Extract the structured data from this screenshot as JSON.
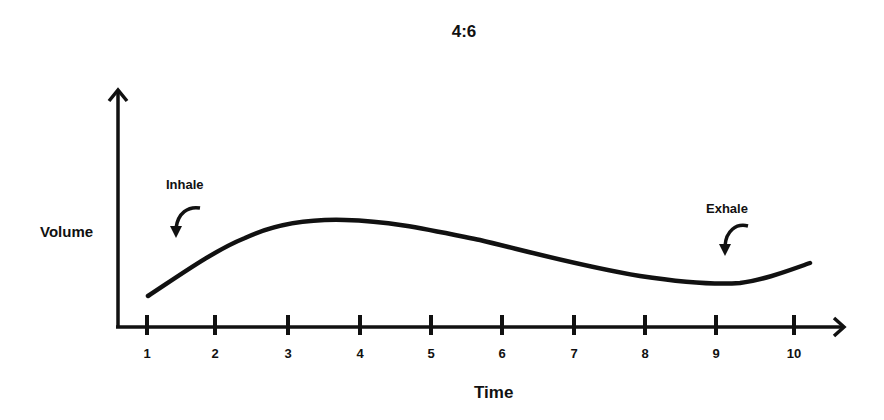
{
  "chart_data": {
    "type": "line",
    "title": "4:6",
    "xlabel": "Time",
    "ylabel": "Volume",
    "x_ticks": [
      "1",
      "2",
      "3",
      "4",
      "5",
      "6",
      "7",
      "8",
      "9",
      "10"
    ],
    "xlim": [
      0.6,
      10.6
    ],
    "ylim": [
      0,
      1
    ],
    "grid": false,
    "legend": "none",
    "series": [
      {
        "name": "Breathing volume",
        "color": "#111111",
        "x": [
          1.0,
          1.5,
          2.0,
          2.5,
          3.0,
          3.5,
          4.0,
          4.5,
          5.0,
          5.5,
          6.0,
          6.5,
          7.0,
          7.5,
          8.0,
          8.5,
          9.0,
          9.3,
          9.6,
          10.0,
          10.2
        ],
        "y": [
          0.15,
          0.28,
          0.42,
          0.53,
          0.6,
          0.63,
          0.63,
          0.61,
          0.58,
          0.54,
          0.49,
          0.44,
          0.39,
          0.35,
          0.31,
          0.28,
          0.27,
          0.27,
          0.3,
          0.36,
          0.39
        ]
      }
    ],
    "annotations": [
      {
        "text": "Inhale",
        "x": 1.5,
        "y": 0.85,
        "arrow": "curved-down"
      },
      {
        "text": "Exhale",
        "x": 9.2,
        "y": 0.7,
        "arrow": "curved-down"
      }
    ]
  },
  "labels": {
    "title": "4:6",
    "xlabel": "Time",
    "ylabel": "Volume",
    "inhale": "Inhale",
    "exhale": "Exhale",
    "ticks": [
      "1",
      "2",
      "3",
      "4",
      "5",
      "6",
      "7",
      "8",
      "9",
      "10"
    ]
  }
}
